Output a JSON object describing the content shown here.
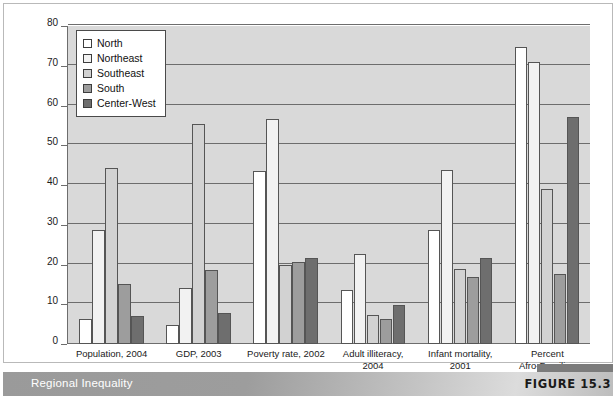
{
  "figure": {
    "title": "Regional Inequality",
    "number_label": "FIGURE 15.3"
  },
  "colors": {
    "north": "#ffffff",
    "northeast": "#f2f2f2",
    "southeast": "#d2d2d2",
    "south": "#9d9d9d",
    "center_west": "#6e6e6e",
    "plot_background": "#d9d9d9",
    "gridline": "#6d6d6d",
    "bar_outline": "#555555",
    "banner": "#9a9a9a",
    "banner_text": "#ffffff"
  },
  "chart_data": {
    "type": "bar",
    "title": "Regional Inequality",
    "xlabel": "",
    "ylabel": "",
    "ylim": [
      0,
      80
    ],
    "yticks": [
      0,
      10,
      20,
      30,
      40,
      50,
      60,
      70,
      80
    ],
    "ytick_labels": [
      "0",
      "10",
      "20",
      "30",
      "40",
      "50",
      "60",
      "70",
      "80"
    ],
    "grid": true,
    "legend_position": "upper-left",
    "categories": [
      "Population, 2004",
      "GDP, 2003",
      "Poverty rate, 2002",
      "Adult illiteracy,\n2004",
      "Infant mortality,\n2001",
      "Percent\nAfro-Brazilian"
    ],
    "series": [
      {
        "name": "North",
        "values": [
          6.2,
          4.9,
          43.5,
          13.7,
          28.8,
          74.8
        ]
      },
      {
        "name": "Northeast",
        "values": [
          28.8,
          14.0,
          56.6,
          22.6,
          43.8,
          71.0
        ]
      },
      {
        "name": "Southeast",
        "values": [
          44.2,
          55.3,
          19.8,
          7.4,
          18.8,
          39.1
        ]
      },
      {
        "name": "South",
        "values": [
          15.1,
          18.7,
          20.6,
          6.2,
          16.8,
          17.7
        ]
      },
      {
        "name": "Center-West",
        "values": [
          7.0,
          7.7,
          21.6,
          9.7,
          21.7,
          57.2
        ]
      }
    ]
  },
  "legend": {
    "items": [
      {
        "label": "North",
        "color": "#ffffff"
      },
      {
        "label": "Northeast",
        "color": "#f2f2f2"
      },
      {
        "label": "Southeast",
        "color": "#d2d2d2"
      },
      {
        "label": "South",
        "color": "#9d9d9d"
      },
      {
        "label": "Center-West",
        "color": "#6e6e6e"
      }
    ]
  }
}
